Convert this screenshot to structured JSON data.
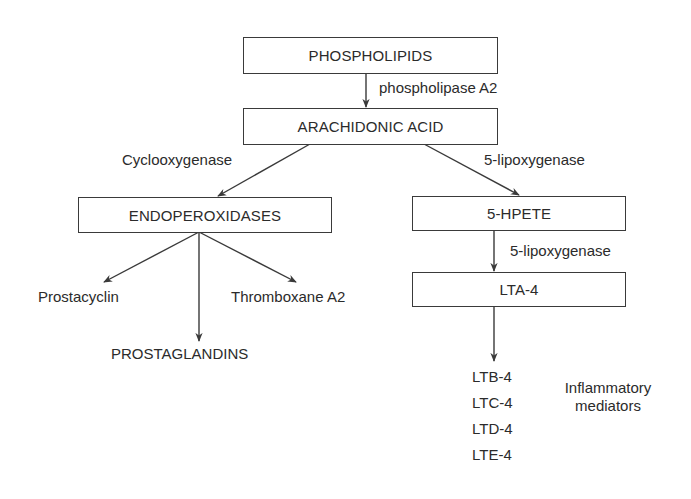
{
  "diagram": {
    "type": "flowchart",
    "title": "",
    "nodes": {
      "phospholipids": "PHOSPHOLIPIDS",
      "arachidonic_acid": "ARACHIDONIC ACID",
      "endoperoxidases": "ENDOPEROXIDASES",
      "hpete": "5-HPETE",
      "lta4": "LTA-4",
      "prostacyclin": "Prostacyclin",
      "thromboxane": "Thromboxane A2",
      "prostaglandins": "PROSTAGLANDINS",
      "ltb4": "LTB-4",
      "ltc4": "LTC-4",
      "ltd4": "LTD-4",
      "lte4": "LTE-4"
    },
    "edge_labels": {
      "phospholipase": "phospholipase A2",
      "cyclooxygenase": "Cyclooxygenase",
      "lipoxygenase_1": "5-lipoxygenase",
      "lipoxygenase_2": "5-lipoxygenase"
    },
    "annotations": {
      "inflammatory_line1": "Inflammatory",
      "inflammatory_line2": "mediators"
    },
    "edges": [
      {
        "from": "PHOSPHOLIPIDS",
        "to": "ARACHIDONIC ACID",
        "label": "phospholipase A2"
      },
      {
        "from": "ARACHIDONIC ACID",
        "to": "ENDOPEROXIDASES",
        "label": "Cyclooxygenase"
      },
      {
        "from": "ARACHIDONIC ACID",
        "to": "5-HPETE",
        "label": "5-lipoxygenase"
      },
      {
        "from": "5-HPETE",
        "to": "LTA-4",
        "label": "5-lipoxygenase"
      },
      {
        "from": "ENDOPEROXIDASES",
        "to": "Prostacyclin",
        "label": ""
      },
      {
        "from": "ENDOPEROXIDASES",
        "to": "PROSTAGLANDINS",
        "label": ""
      },
      {
        "from": "ENDOPEROXIDASES",
        "to": "Thromboxane A2",
        "label": ""
      },
      {
        "from": "LTA-4",
        "to": "LTB-4 / LTC-4 / LTD-4 / LTE-4",
        "label": ""
      }
    ],
    "colors": {
      "line": "#3a3a3a",
      "text": "#2b2b2b",
      "background": "#ffffff"
    }
  }
}
